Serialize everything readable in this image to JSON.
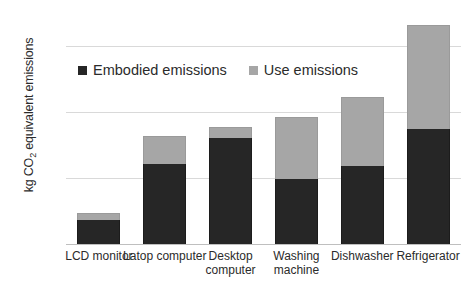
{
  "chart_data": {
    "type": "bar",
    "stacked": true,
    "title": "",
    "xlabel": "",
    "ylabel": "kg CO2 equivalent emissions",
    "ylabel_prefix": "kg CO",
    "ylabel_subscript": "2",
    "ylabel_suffix": " equivalent emissions",
    "categories": [
      "LCD monitor",
      "Latop computer",
      "Desktop computer",
      "Washing machine",
      "Dishwasher",
      "Refrigerator"
    ],
    "series": [
      {
        "name": "Embodied emissions",
        "color": "#262626",
        "values": [
          72,
          242,
          320,
          196,
          236,
          350
        ]
      },
      {
        "name": "Use emissions",
        "color": "#a6a6a6",
        "values": [
          23,
          85,
          35,
          190,
          210,
          315
        ]
      }
    ],
    "totals": [
      95,
      327,
      355,
      386,
      446,
      665
    ],
    "ylim": [
      0,
      700
    ],
    "yticks": [
      0,
      200,
      400,
      600
    ],
    "ytick_labels": [
      "0",
      "200",
      "400",
      "600"
    ],
    "grid": true,
    "legend_position": "inside-top-left",
    "legend": [
      {
        "label": "Embodied emissions",
        "color": "#262626"
      },
      {
        "label": "Use emissions",
        "color": "#a6a6a6"
      }
    ]
  }
}
